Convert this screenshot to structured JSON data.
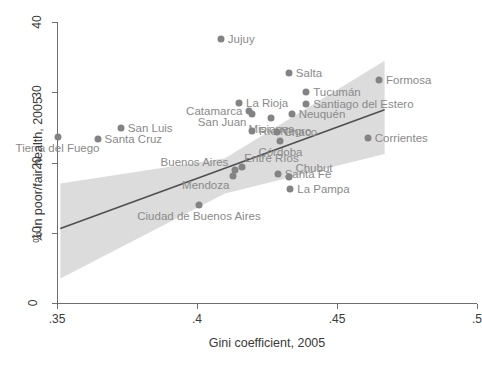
{
  "chart_data": {
    "type": "scatter",
    "title": "",
    "xlabel": "Gini coefficient, 2005",
    "ylabel": "% in poor/fair health, 2005",
    "xlim": [
      0.35,
      0.5
    ],
    "ylim": [
      0,
      40
    ],
    "xticks": [
      ".35",
      ".4",
      ".45",
      ".5"
    ],
    "xtick_values": [
      0.35,
      0.4,
      0.45,
      0.5
    ],
    "yticks": [
      "0",
      "10",
      "20",
      "30",
      "40"
    ],
    "ytick_values": [
      0,
      10,
      20,
      30,
      40
    ],
    "grid": false,
    "legend": "none",
    "marker_color": "#838383",
    "label_color": "#8a8a8a",
    "fit_line_color": "#4f4f4f",
    "ci_band_color": "#dcdcdc",
    "points": [
      {
        "name": "Tierra del Fuego",
        "x": 0.3502,
        "y": 23.7,
        "lpos": "below"
      },
      {
        "name": "Santa Cruz",
        "x": 0.3645,
        "y": 23.3,
        "lpos": "right"
      },
      {
        "name": "San Luis",
        "x": 0.3728,
        "y": 24.9,
        "lpos": "right"
      },
      {
        "name": "Jujuy",
        "x": 0.4085,
        "y": 37.6,
        "lpos": "right"
      },
      {
        "name": "La Rioja",
        "x": 0.415,
        "y": 28.4,
        "lpos": "right"
      },
      {
        "name": "Catamarca",
        "x": 0.4187,
        "y": 27.3,
        "lpos": "left"
      },
      {
        "name": "San Juan",
        "x": 0.4198,
        "y": 26.9,
        "lpos": "leftlow"
      },
      {
        "name": "Salta",
        "x": 0.4328,
        "y": 32.7,
        "lpos": "right"
      },
      {
        "name": "Tucumán",
        "x": 0.439,
        "y": 30.1,
        "lpos": "right"
      },
      {
        "name": "Santiago del Estero",
        "x": 0.439,
        "y": 28.3,
        "lpos": "right"
      },
      {
        "name": "Formosa",
        "x": 0.465,
        "y": 31.7,
        "lpos": "right"
      },
      {
        "name": "Neuquén",
        "x": 0.4338,
        "y": 26.9,
        "lpos": "right"
      },
      {
        "name": "Misiones",
        "x": 0.4265,
        "y": 26.4,
        "lpos": "below"
      },
      {
        "name": "Río Negro",
        "x": 0.4196,
        "y": 24.5,
        "lpos": "right"
      },
      {
        "name": "Chaco",
        "x": 0.4285,
        "y": 24.3,
        "lpos": "right"
      },
      {
        "name": "Corrientes",
        "x": 0.461,
        "y": 23.5,
        "lpos": "right"
      },
      {
        "name": "Córdoba",
        "x": 0.4298,
        "y": 23.0,
        "lpos": "below"
      },
      {
        "name": "Buenos Aires",
        "x": 0.4137,
        "y": 19.0,
        "lpos": "leftup"
      },
      {
        "name": "Entre Ríos",
        "x": 0.4162,
        "y": 19.3,
        "lpos": "up"
      },
      {
        "name": "Mendoza",
        "x": 0.413,
        "y": 18.1,
        "lpos": "leftlow2"
      },
      {
        "name": "Santa Fe",
        "x": 0.4288,
        "y": 18.3,
        "lpos": "right"
      },
      {
        "name": "Chubut",
        "x": 0.433,
        "y": 18.0,
        "lpos": "upright"
      },
      {
        "name": "La Pampa",
        "x": 0.4333,
        "y": 16.2,
        "lpos": "right"
      },
      {
        "name": "Ciudad de Buenos Aires",
        "x": 0.4007,
        "y": 14.0,
        "lpos": "below"
      }
    ],
    "fit_line": {
      "x1": 0.3512,
      "y1": 10.6,
      "x2": 0.467,
      "y2": 27.5
    },
    "ci_band": {
      "upper": [
        {
          "x": 0.3512,
          "y": 17.0
        },
        {
          "x": 0.41,
          "y": 20.6
        },
        {
          "x": 0.467,
          "y": 34.5
        }
      ],
      "lower": [
        {
          "x": 0.3512,
          "y": 3.5
        },
        {
          "x": 0.41,
          "y": 15.6
        },
        {
          "x": 0.467,
          "y": 21.2
        }
      ]
    }
  }
}
